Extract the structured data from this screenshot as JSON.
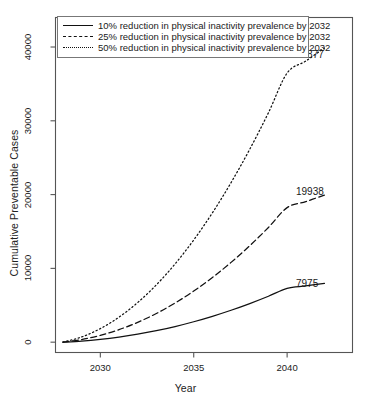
{
  "chart_data": {
    "type": "line",
    "title": "",
    "xlabel": "Year",
    "ylabel": "Cumulative Preventable Cases",
    "xlim": [
      2027.6,
      2043.5
    ],
    "ylim": [
      -1400,
      44000
    ],
    "xticks": [
      2030,
      2035,
      2040
    ],
    "yticks": [
      0,
      10000,
      20000,
      30000,
      40000
    ],
    "xtick_labels": [
      "2030",
      "2035",
      "2040"
    ],
    "ytick_labels": [
      "0",
      "10000",
      "20000",
      "30000",
      "40000"
    ],
    "grid": false,
    "legend_position": "top-left",
    "x": [
      2028,
      2029,
      2030,
      2031,
      2032,
      2033,
      2034,
      2035,
      2036,
      2037,
      2038,
      2039,
      2040,
      2041,
      2042
    ],
    "series": [
      {
        "name": "10% reduction in physical inactivity prevalence by 2032",
        "style": "solid",
        "end_label": "7975",
        "values": [
          0,
          141,
          367,
          678,
          1074,
          1554,
          2120,
          2770,
          3505,
          4325,
          5230,
          6219,
          7294,
          7620,
          7975
        ]
      },
      {
        "name": "25% reduction in physical inactivity prevalence by 2032",
        "style": "dashed",
        "end_label": "19938",
        "values": [
          0,
          353,
          918,
          1695,
          2685,
          3886,
          5300,
          6925,
          8763,
          10812,
          13074,
          15547,
          18233,
          19050,
          19938
        ]
      },
      {
        "name": "50% reduction in physical inactivity prevalence by 2032",
        "style": "dotted",
        "end_label": "39877",
        "values": [
          0,
          706,
          1836,
          3390,
          5369,
          7772,
          10599,
          13851,
          17526,
          21625,
          26148,
          31095,
          36466,
          38100,
          39877
        ]
      }
    ]
  },
  "legend": {
    "items": [
      {
        "label": "10% reduction in physical inactivity prevalence by 2032",
        "style": "solid"
      },
      {
        "label": "25% reduction in physical inactivity prevalence by 2032",
        "style": "dashed"
      },
      {
        "label": "50% reduction in physical inactivity prevalence by 2032",
        "style": "dotted"
      }
    ]
  },
  "colors": {
    "line": "#111111",
    "axis": "#555555",
    "background": "#ffffff",
    "text": "#1a1a1a"
  }
}
